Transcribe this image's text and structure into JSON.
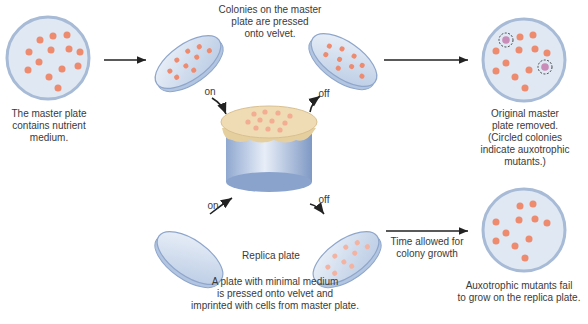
{
  "labels": {
    "master_plate": "The master plate\ncontains nutrient\nmedium.",
    "pressed": "Colonies on the master\nplate are pressed\nonto velvet.",
    "removed": "Original master\nplate removed.\n(Circled colonies\nindicate auxotrophic\nmutants.)",
    "replica": "Replica plate",
    "minimal": "A plate with minimal medium\nis pressed onto velvet and\nimprinted with cells from master plate.",
    "time": "Time allowed for\ncolony growth",
    "fail": "Auxotrophic mutants fail\nto grow on the replica plate.",
    "on_top": "on",
    "off_top": "off",
    "on_bottom": "on",
    "off_bottom": "off"
  },
  "colors": {
    "colony": "#ee8a6e",
    "mutant": "#c98bb8",
    "plate_fill": "#dfe8f3",
    "plate_rim": "#9fb5d3",
    "velvet": "#efdcb4",
    "jar": "#a9bedf"
  }
}
